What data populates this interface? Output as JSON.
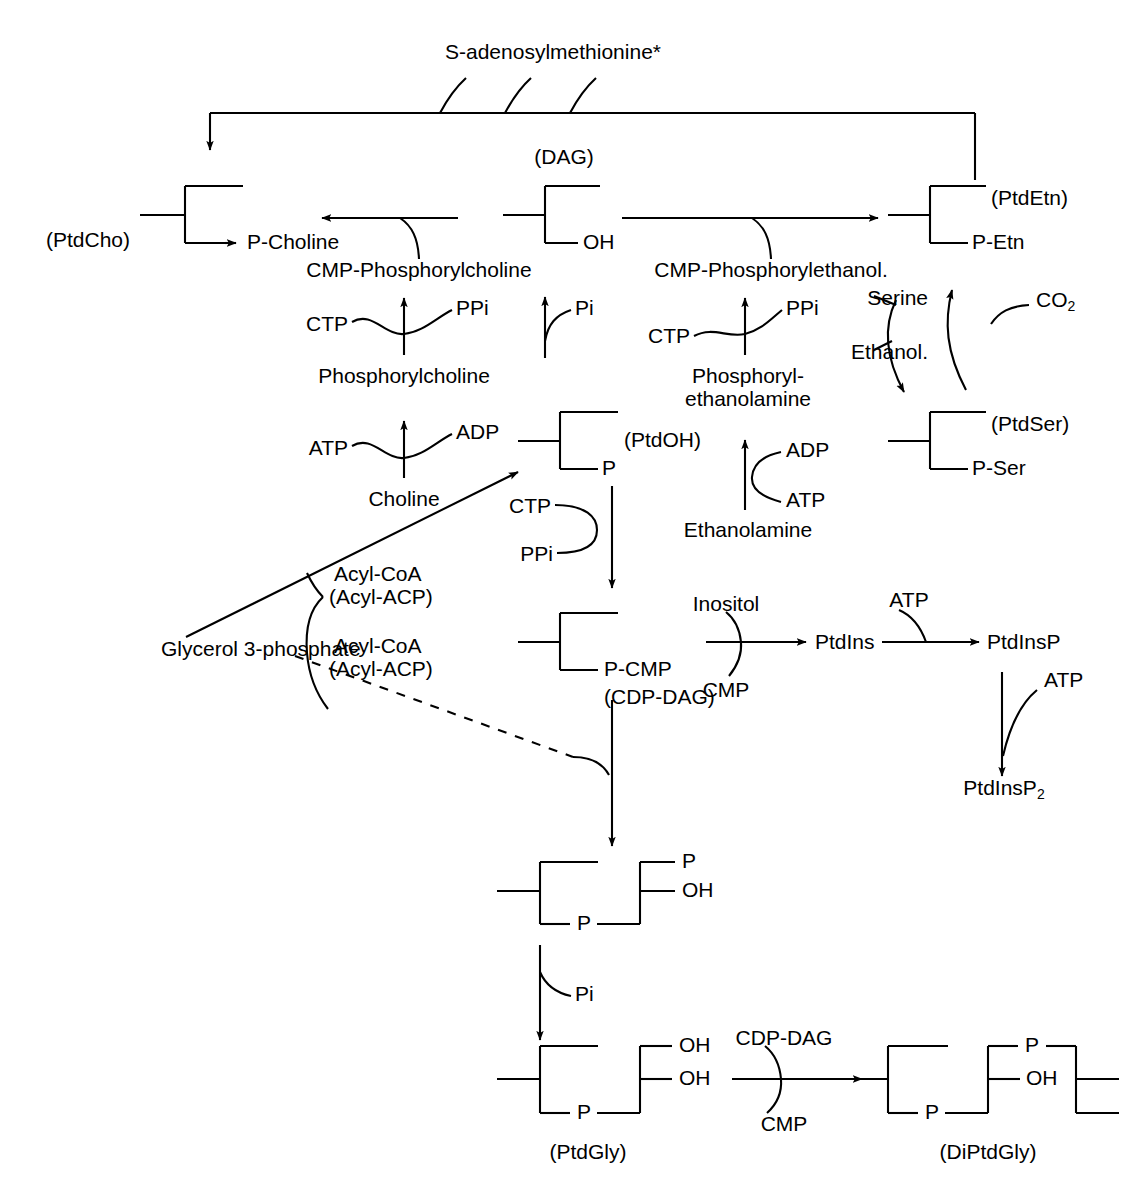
{
  "diagram": {
    "top_donor": "S-adenosylmethionine*",
    "nodes": {
      "ptdcho": "(PtdCho)",
      "p_choline": "P-Choline",
      "cmp_phosphorylcholine": "CMP-Phosphorylcholine",
      "phosphorylcholine": "Phosphorylcholine",
      "choline": "Choline",
      "dag": "(DAG)",
      "dag_oh": "OH",
      "cmp_phosphorylethanol": "CMP-Phosphorylethanol.",
      "phosphorylethanolamine_l1": "Phosphoryl-",
      "phosphorylethanolamine_l2": "ethanolamine",
      "ethanolamine": "Ethanolamine",
      "ptdetn": "(PtdEtn)",
      "p_etn": "P-Etn",
      "ptdser": "(PtdSer)",
      "p_ser": "P-Ser",
      "ptdoh": "(PtdOH)",
      "ptdoh_p": "P",
      "glycerol3p": "Glycerol 3-phosphate",
      "p_cmp": "P-CMP",
      "cdp_dag": "(CDP-DAG)",
      "ptdins": "PtdIns",
      "ptdinsp": "PtdInsP",
      "ptdinsp2_base": "PtdInsP",
      "ptdinsp2_sub": "2",
      "ptdgly": "(PtdGly)",
      "diptdgly": "(DiPtdGly)",
      "mid_p_top": "P",
      "mid_oh": "OH",
      "mid_bridge_p": "P",
      "ptdgly_oh1": "OH",
      "ptdgly_oh2": "OH",
      "ptdgly_bridge_p": "P",
      "diptdgly_p_top": "P",
      "diptdgly_oh": "OH",
      "diptdgly_bridge_p": "P"
    },
    "cofactors": {
      "ctp_1": "CTP",
      "ppi_1": "PPi",
      "atp_1": "ATP",
      "adp_1": "ADP",
      "pi_1": "Pi",
      "ctp_2": "CTP",
      "ppi_2": "PPi",
      "adp_2": "ADP",
      "atp_2": "ATP",
      "serine": "Serine",
      "ethanol": "Ethanol.",
      "co2_base": "CO",
      "co2_sub": "2",
      "ctp_3": "CTP",
      "ppi_3": "PPi",
      "acyl_coa_1_l1": "Acyl-CoA",
      "acyl_coa_1_l2": "(Acyl-ACP)",
      "acyl_coa_2_l1": "Acyl-CoA",
      "acyl_coa_2_l2": "(Acyl-ACP)",
      "inositol": "Inositol",
      "cmp_1": "CMP",
      "atp_3": "ATP",
      "atp_4": "ATP",
      "pi_2": "Pi",
      "cdp_dag_cof": "CDP-DAG",
      "cmp_2": "CMP"
    },
    "colors": {
      "stroke": "#000000",
      "background": "#ffffff"
    }
  }
}
